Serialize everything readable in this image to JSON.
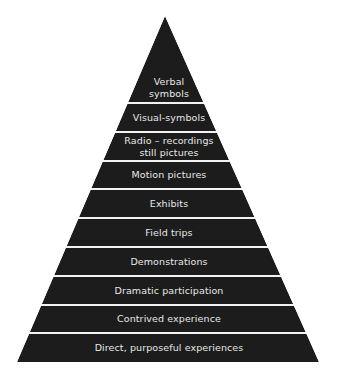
{
  "diagram": {
    "type": "pyramid",
    "colors": {
      "fill": "#1c1c1c",
      "separator": "#f2f2f2",
      "text": "#e8e8e8",
      "background": "#ffffff"
    },
    "levels": [
      {
        "label": "Verbal symbols",
        "lines": [
          "Verbal",
          "symbols"
        ]
      },
      {
        "label": "Visual-symbols",
        "lines": [
          "Visual-symbols"
        ]
      },
      {
        "label": "Radio – recordings still pictures",
        "lines": [
          "Radio – recordings",
          "still pictures"
        ]
      },
      {
        "label": "Motion pictures",
        "lines": [
          "Motion pictures"
        ]
      },
      {
        "label": "Exhibits",
        "lines": [
          "Exhibits"
        ]
      },
      {
        "label": "Field trips",
        "lines": [
          "Field trips"
        ]
      },
      {
        "label": "Demonstrations",
        "lines": [
          "Demonstrations"
        ]
      },
      {
        "label": "Dramatic participation",
        "lines": [
          "Dramatic participation"
        ]
      },
      {
        "label": "Contrived experience",
        "lines": [
          "Contrived experience"
        ]
      },
      {
        "label": "Direct, purposeful experiences",
        "lines": [
          "Direct, purposeful experiences"
        ]
      }
    ]
  }
}
